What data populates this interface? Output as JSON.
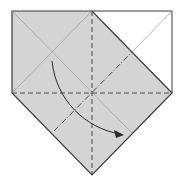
{
  "diagram": {
    "colors": {
      "paper_shaded": "#d4d4d4",
      "paper_white": "#ffffff",
      "edge": "#3a3a3a",
      "crease": "#9a9a9a",
      "valley_fold": "#4a4a4a",
      "arrow": "#2a2a2a"
    },
    "elements": [
      {
        "name": "shaded-paper-region",
        "kind": "region"
      },
      {
        "name": "white-corner-region",
        "kind": "region"
      },
      {
        "name": "valley-fold-line-horizontal",
        "kind": "valley-fold"
      },
      {
        "name": "valley-fold-line-vertical",
        "kind": "valley-fold"
      },
      {
        "name": "mountain-fold-line-diagonal",
        "kind": "mountain-fold"
      },
      {
        "name": "fold-direction-arrow",
        "kind": "arrow"
      }
    ]
  }
}
